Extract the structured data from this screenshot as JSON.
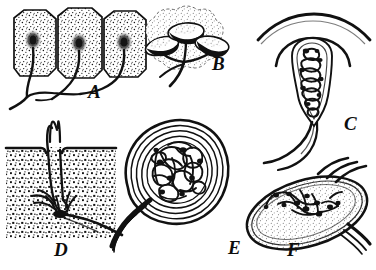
{
  "figure": {
    "style": "black-and-white stipple engraving",
    "background_color": "#ffffff",
    "ink_color": "#0d0d0d",
    "panel_count": 6
  },
  "panels": [
    {
      "label": "A",
      "name": "free-nerve-endings-in-epithelial-cells",
      "description": "Three columnar stippled epithelial cells, each with a dark nucleus, with nerve fibres leaving the base and converging into a common trunk",
      "label_x": 88,
      "label_y": 82,
      "label_size": 19
    },
    {
      "label": "B",
      "name": "taste-bud-like-cup-endings",
      "description": "Three cup-shaped dark-rimmed end organs on a branching nerve fibre within a stippled tissue mass",
      "label_x": 212,
      "label_y": 54,
      "label_size": 19
    },
    {
      "label": "C",
      "name": "encapsulated-corpuscle-beneath-surface",
      "description": "Elongated encapsulated corpuscle containing a densely coiled nerve ending, lying beneath an arched epidermal surface line, with nerve fibres descending below",
      "label_x": 344,
      "label_y": 114,
      "label_size": 19
    },
    {
      "label": "D",
      "name": "hair-follicle-nerve-ending",
      "description": "Section of stippled skin with a hair shaft passing through the surface and nerve fibres wrapping the follicle base",
      "label_x": 54,
      "label_y": 240,
      "label_size": 19
    },
    {
      "label": "E",
      "name": "lamellated-pacinian-corpuscle",
      "description": "Large rounded lamellated corpuscle with a thick concentric capsule enclosing a dense glomerular tangle of nerve endings, with a thick nerve trunk entering at the lower left",
      "label_x": 228,
      "label_y": 238,
      "label_size": 19
    },
    {
      "label": "F",
      "name": "oval-end-bulb-corpuscle",
      "description": "Tilted oval end bulb with stippled interior and branching beaded nerve terminals, entered by nerve fibres from the upper right",
      "label_x": 287,
      "label_y": 240,
      "label_size": 19
    }
  ]
}
